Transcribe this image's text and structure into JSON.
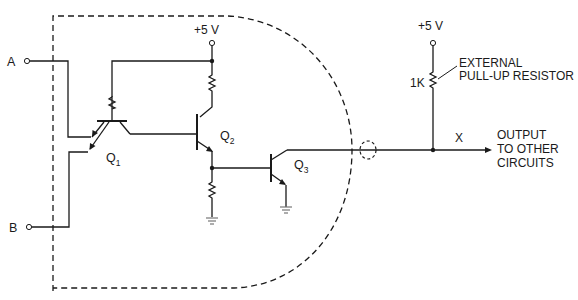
{
  "figure": {
    "type": "circuit-schematic"
  },
  "inputs": {
    "a": "A",
    "b": "B"
  },
  "supply": {
    "internal": "+5 V",
    "external": "+5 V"
  },
  "transistors": {
    "q1": {
      "letter": "Q",
      "sub": "1"
    },
    "q2": {
      "letter": "Q",
      "sub": "2"
    },
    "q3": {
      "letter": "Q",
      "sub": "3"
    }
  },
  "pullup": {
    "value": "1K",
    "label_line1": "EXTERNAL",
    "label_line2": "PULL-UP RESISTOR"
  },
  "output": {
    "node": "X",
    "line1": "OUTPUT",
    "line2": "TO OTHER",
    "line3": "CIRCUITS"
  }
}
